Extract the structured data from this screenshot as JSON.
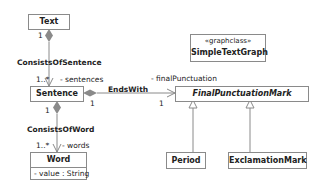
{
  "classes": {
    "text": {
      "name": "Text"
    },
    "sentence": {
      "name": "Sentence"
    },
    "word": {
      "name": "Word",
      "attributes": [
        "- value : String"
      ]
    },
    "final_punctuation_mark": {
      "name": "FinalPunctuationMark",
      "abstract": true
    },
    "simple_text_graph": {
      "stereotype": "«graphclass»",
      "name": "SimpleTextGraph"
    },
    "period": {
      "name": "Period"
    },
    "exclamation_mark": {
      "name": "ExclamationMark"
    }
  },
  "associations": {
    "consists_of_sentence": {
      "name": "ConsistsOfSentence",
      "source_multiplicity": "1",
      "target_multiplicity": "1..*",
      "target_role": "- sentences"
    },
    "consists_of_word": {
      "name": "ConsistsOfWord",
      "source_multiplicity": "1",
      "target_multiplicity": "1..*",
      "target_role": "- words"
    },
    "ends_with": {
      "name": "EndsWith",
      "source_multiplicity": "1",
      "target_multiplicity": "1",
      "target_role": "- finalPunctuation"
    }
  },
  "colors": {
    "line": "#8a8a8a",
    "diamond": "#8a8a8a"
  }
}
